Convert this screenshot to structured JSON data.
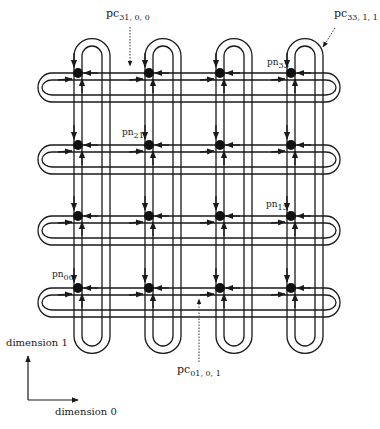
{
  "diagram": {
    "title": "",
    "grid": {
      "rows": 4,
      "cols": 4
    },
    "columns_x": [
      78,
      149,
      220,
      291
    ],
    "rows_y": [
      288,
      216,
      145,
      73
    ],
    "colors": {
      "line": "#1a1a1a",
      "node": "#111111",
      "dotted": "#333333",
      "background": "#ffffff"
    },
    "labels": {
      "pc_31_0_0": {
        "base": "pc",
        "sub": "31, 0, 0"
      },
      "pc_33_1_1": {
        "base": "pc",
        "sub": "33, 1, 1"
      },
      "pc_01_0_1": {
        "base": "pc",
        "sub": "01, 0, 1"
      },
      "pn_33": {
        "base": "pn",
        "sub": "33"
      },
      "pn_21": {
        "base": "pn",
        "sub": "21"
      },
      "pn_13": {
        "base": "pn",
        "sub": "13"
      },
      "pn_00": {
        "base": "pn",
        "sub": "00"
      }
    },
    "axes": {
      "dimension1": "dimension 1",
      "dimension0": "dimension 0"
    },
    "nodes": [
      {
        "id": "pn00",
        "row": 0,
        "col": 0
      },
      {
        "id": "pn01",
        "row": 0,
        "col": 1
      },
      {
        "id": "pn02",
        "row": 0,
        "col": 2
      },
      {
        "id": "pn03",
        "row": 0,
        "col": 3
      },
      {
        "id": "pn10",
        "row": 1,
        "col": 0
      },
      {
        "id": "pn11",
        "row": 1,
        "col": 1
      },
      {
        "id": "pn12",
        "row": 1,
        "col": 2
      },
      {
        "id": "pn13",
        "row": 1,
        "col": 3
      },
      {
        "id": "pn20",
        "row": 2,
        "col": 0
      },
      {
        "id": "pn21",
        "row": 2,
        "col": 1
      },
      {
        "id": "pn22",
        "row": 2,
        "col": 2
      },
      {
        "id": "pn23",
        "row": 2,
        "col": 3
      },
      {
        "id": "pn30",
        "row": 3,
        "col": 0
      },
      {
        "id": "pn31",
        "row": 3,
        "col": 1
      },
      {
        "id": "pn32",
        "row": 3,
        "col": 2
      },
      {
        "id": "pn33",
        "row": 3,
        "col": 3
      }
    ]
  }
}
